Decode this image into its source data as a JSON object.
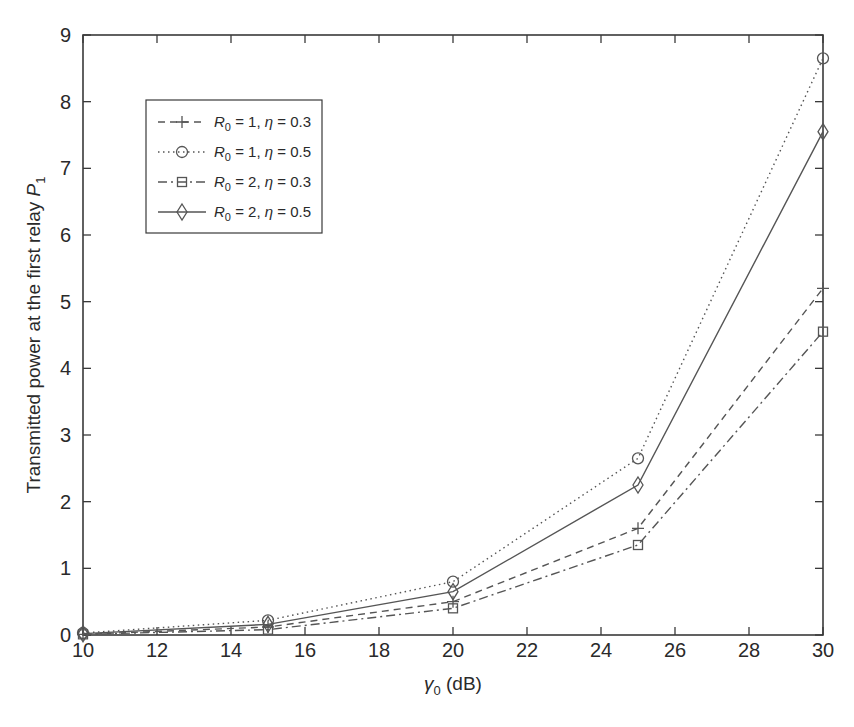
{
  "chart_data": {
    "type": "line",
    "title": "",
    "xlabel": "γ0 (dB)",
    "xlabel_main": "γ",
    "xlabel_sub": "0",
    "xlabel_unit": " (dB)",
    "ylabel": "Transmitted power at the first relay P1",
    "ylabel_main": "Transmitted power at the first relay ",
    "ylabel_var": "P",
    "ylabel_sub": "1",
    "x": [
      10,
      15,
      20,
      25,
      30
    ],
    "xlim": [
      10,
      30
    ],
    "ylim": [
      0,
      9
    ],
    "xticks": [
      10,
      12,
      14,
      16,
      18,
      20,
      22,
      24,
      26,
      28,
      30
    ],
    "yticks": [
      0,
      1,
      2,
      3,
      4,
      5,
      6,
      7,
      8,
      9
    ],
    "grid": false,
    "legend_position": "upper left",
    "series": [
      {
        "name": "R0 = 1, η = 0.3",
        "R": "1",
        "eta": "0.3",
        "linestyle": "dashed",
        "marker": "plus",
        "values": [
          0.01,
          0.12,
          0.5,
          1.6,
          5.2
        ]
      },
      {
        "name": "R0 = 1, η = 0.5",
        "R": "1",
        "eta": "0.5",
        "linestyle": "dotted",
        "marker": "circle",
        "values": [
          0.03,
          0.22,
          0.8,
          2.65,
          8.65
        ]
      },
      {
        "name": "R0 = 2, η = 0.3",
        "R": "2",
        "eta": "0.3",
        "linestyle": "dashdot",
        "marker": "square",
        "values": [
          0.01,
          0.08,
          0.4,
          1.35,
          4.55
        ]
      },
      {
        "name": "R0 = 2, η = 0.5",
        "R": "2",
        "eta": "0.5",
        "linestyle": "solid",
        "marker": "diamond",
        "values": [
          0.02,
          0.16,
          0.65,
          2.25,
          7.55
        ]
      }
    ]
  },
  "colors": {
    "line": "#555555",
    "axis": "#3a3a3a",
    "text": "#2a2a2a"
  }
}
